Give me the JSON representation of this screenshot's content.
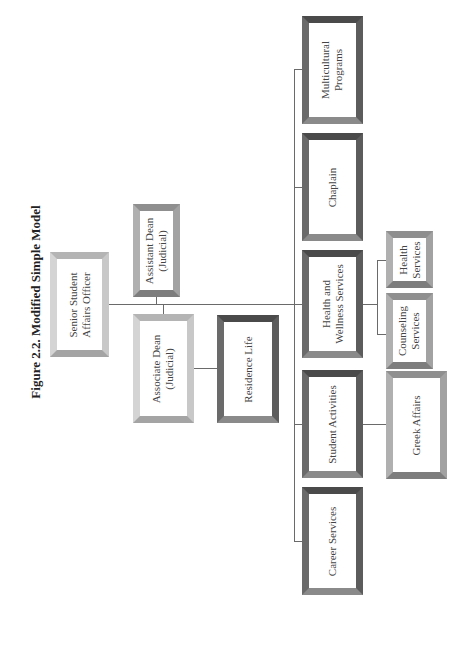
{
  "figure": {
    "title": "Figure 2.2.  Modified Simple Model",
    "orientation": "rotated -90deg"
  },
  "nodes": {
    "senior_officer": {
      "line1": "Senior Student",
      "line2": "Affairs Officer"
    },
    "assistant_dean": {
      "line1": "Assistant Dean",
      "line2": "(Judicial)"
    },
    "associate_dean": {
      "line1": "Associate Dean",
      "line2": "(Judicial)"
    },
    "residence_life": {
      "line1": "Residence Life"
    },
    "multicultural": {
      "line1": "Multicultural",
      "line2": "Programs"
    },
    "chaplain": {
      "line1": "Chaplain"
    },
    "health_wellness": {
      "line1": "Health and",
      "line2": "Wellness Services"
    },
    "student_activities": {
      "line1": "Student Activities"
    },
    "career_services": {
      "line1": "Career Services"
    },
    "health_services": {
      "line1": "Health",
      "line2": "Services"
    },
    "counseling_services": {
      "line1": "Counseling",
      "line2": "Services"
    },
    "greek_affairs": {
      "line1": "Greek Affairs"
    }
  },
  "hierarchy": {
    "Senior Student Affairs Officer": [
      "Assistant Dean (Judicial)",
      "Associate Dean (Judicial)",
      "Multicultural Programs",
      "Chaplain",
      "Health and Wellness Services",
      "Student Activities",
      "Career Services"
    ],
    "Associate Dean (Judicial)": [
      "Residence Life"
    ],
    "Health and Wellness Services": [
      "Health Services",
      "Counseling Services"
    ],
    "Student Activities": [
      "Greek Affairs"
    ]
  }
}
